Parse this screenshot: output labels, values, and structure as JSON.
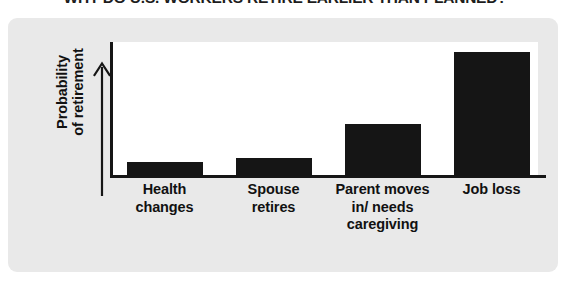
{
  "title": "WHY DO U.S. WORKERS RETIRE EARLIER THAN PLANNED?",
  "axis": {
    "y_title_line1": "Probability",
    "y_title_line2": "of retirement",
    "y_arrow_icon": "up-arrow-icon"
  },
  "colors": {
    "card_background": "#e9e9e9",
    "plot_background": "#ffffff",
    "bar": "#151515",
    "axis": "#161616",
    "text": "#111111",
    "title": "#1d1d1d"
  },
  "chart_data": {
    "type": "bar",
    "title": "WHY DO U.S. WORKERS RETIRE EARLIER THAN PLANNED?",
    "xlabel": "",
    "ylabel": "Probability of retirement",
    "categories": [
      "Health changes",
      "Spouse retires",
      "Parent moves in/ needs caregiving",
      "Job loss"
    ],
    "category_lines": [
      [
        "Health",
        "changes"
      ],
      [
        "Spouse",
        "retires"
      ],
      [
        "Parent moves",
        "in/ needs",
        "caregiving"
      ],
      [
        "Job loss"
      ]
    ],
    "values": [
      0.105,
      0.135,
      0.39,
      0.925
    ],
    "ylim": [
      0,
      1
    ],
    "yticks": [],
    "grid": false,
    "legend": false,
    "axis_style": "arrow-up on y axis, no numeric scale"
  }
}
